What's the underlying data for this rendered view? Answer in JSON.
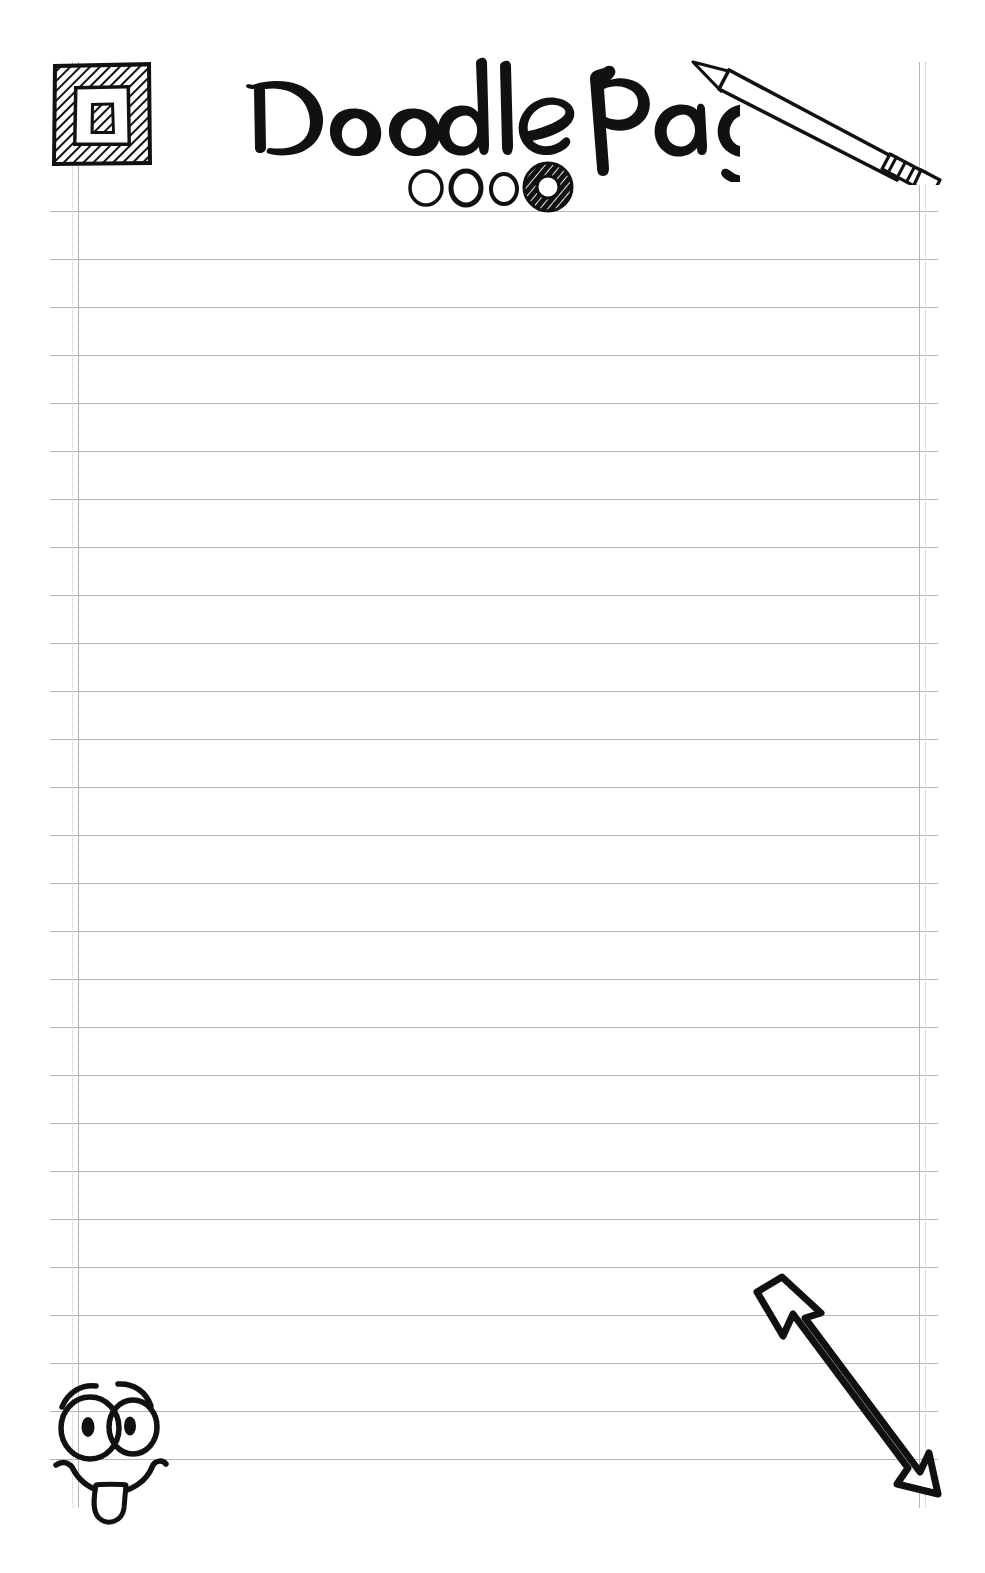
{
  "page": {
    "title": "Doodle Page",
    "background_color": "#ffffff",
    "ink_color": "#111111",
    "rule_color": "#b4b4b4",
    "width": 985,
    "height": 1573
  },
  "header": {
    "title_text": "Doodle Page",
    "frame_icon_name": "square-frame-doodle",
    "pencil_icon_name": "pencil-doodle",
    "dots": {
      "name": "circle-dots-row",
      "count": 4,
      "items": [
        {
          "label": "circle-1",
          "style": "outline",
          "size": "medium"
        },
        {
          "label": "circle-2",
          "style": "outline",
          "size": "medium"
        },
        {
          "label": "circle-3",
          "style": "outline",
          "size": "small"
        },
        {
          "label": "circle-4",
          "style": "hatched-donut",
          "size": "large"
        }
      ]
    }
  },
  "paper": {
    "rule_spacing": 48,
    "first_rule_y": 211,
    "rule_count": 27,
    "rule_left": 50,
    "rule_right": 938,
    "left_margin_lines": [
      72,
      78
    ],
    "right_margin_lines": [
      919,
      925
    ],
    "vertical_top": 62,
    "vertical_bottom": 1508,
    "lines": []
  },
  "doodles": [
    {
      "name": "smiley-face-tongue-doodle",
      "description": "cartoon face with two large eyes, eyebrows, smile and tongue",
      "position": "bottom-left"
    },
    {
      "name": "up-left-arrow-doodle",
      "description": "hollow hand-drawn arrow pointing up-left with notched banner tail",
      "position": "bottom-right"
    }
  ]
}
